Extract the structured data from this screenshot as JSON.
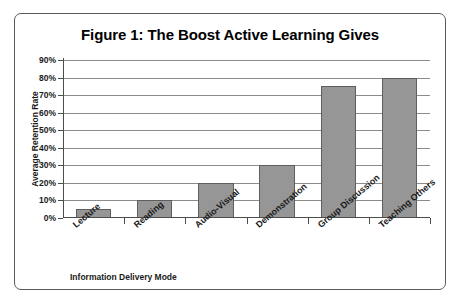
{
  "figure": {
    "title": "Figure 1: The Boost Active Learning Gives"
  },
  "chart_data": {
    "type": "bar",
    "title": "Figure 1: The Boost Active Learning Gives",
    "xlabel": "Information Delivery Mode",
    "ylabel": "Average Retention Rate",
    "categories": [
      "Lecture",
      "Reading",
      "Audio-Visual",
      "Demonstration",
      "Group Discussion",
      "Teaching Others"
    ],
    "values": [
      5,
      10,
      20,
      30,
      75,
      80
    ],
    "ylim": [
      0,
      90
    ],
    "ytick_labels": [
      "0%",
      "10%",
      "20%",
      "30%",
      "40%",
      "50%",
      "60%",
      "70%",
      "80%",
      "90%"
    ],
    "ytick_values": [
      0,
      10,
      20,
      30,
      40,
      50,
      60,
      70,
      80,
      90
    ],
    "grid": true,
    "legend": false,
    "bar_color": "#969696",
    "bar_border_color": "#5e5e5e",
    "grid_color": "#8c8c8c",
    "axis_color": "#4d4d4d",
    "background": "#ffffff"
  }
}
